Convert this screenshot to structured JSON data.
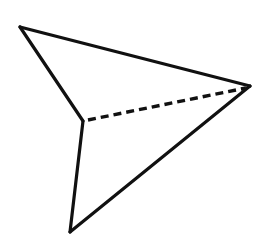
{
  "canvas": {
    "width": 263,
    "height": 248,
    "background_color": "#ffffff"
  },
  "figure": {
    "name": "wireframe-dart-tetrahedron",
    "stroke_color": "#111111",
    "fill_color": "#ffffff",
    "stroke_width": 3.2,
    "hidden_stroke_width": 3.4,
    "dash_pattern": "8 5",
    "vertices": {
      "apex_top_left": {
        "label": "apex-top-left",
        "x": 20,
        "y": 27
      },
      "right": {
        "label": "right-tip",
        "x": 250,
        "y": 86
      },
      "bottom": {
        "label": "bottom-tip",
        "x": 70,
        "y": 232
      },
      "notch_center": {
        "label": "notch-center",
        "x": 83,
        "y": 121
      }
    },
    "outline_path": "M 20 27 L 250 86 L 70 232 L 83 121 Z",
    "edges": [
      {
        "name": "edge-apex-to-right",
        "style": "solid",
        "from": "apex_top_left",
        "to": "right",
        "path": "M 20 27 L 250 86"
      },
      {
        "name": "edge-apex-to-notch",
        "style": "solid",
        "from": "apex_top_left",
        "to": "notch_center",
        "path": "M 20 27 L 83 121"
      },
      {
        "name": "edge-notch-to-bottom",
        "style": "solid",
        "from": "notch_center",
        "to": "bottom",
        "path": "M 83 121 L 70 232"
      },
      {
        "name": "edge-bottom-to-right",
        "style": "solid",
        "from": "bottom",
        "to": "right",
        "path": "M 70 232 L 250 86"
      },
      {
        "name": "edge-notch-to-right-hidden",
        "style": "dashed",
        "from": "notch_center",
        "to": "right",
        "path": "M 88 120 L 246 88"
      }
    ]
  }
}
